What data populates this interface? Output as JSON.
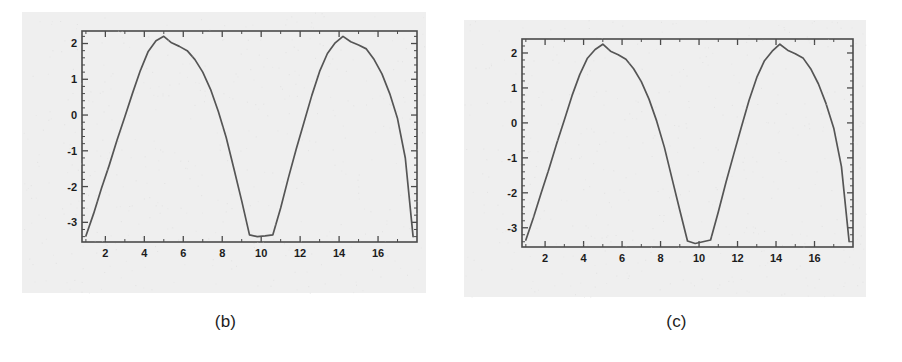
{
  "figure": {
    "background_color": "#ffffff",
    "plate_color": "#eeeeee",
    "line_color": "#555555",
    "axis_color": "#4a4a4a",
    "tick_label_color": "#1c1c1c"
  },
  "panels": [
    {
      "id": "b",
      "caption": "(b)"
    },
    {
      "id": "c",
      "caption": "(c)"
    }
  ],
  "chart_data": [
    {
      "type": "line",
      "panel": "b",
      "title": "",
      "subtitle": "",
      "caption": "(b)",
      "xlabel": "",
      "ylabel": "",
      "xlim": [
        0.8,
        18.0
      ],
      "ylim": [
        -3.55,
        2.35
      ],
      "grid": false,
      "legend": null,
      "frame": "box-with-inward-ticks",
      "x_ticks_major": [
        2,
        4,
        6,
        8,
        10,
        12,
        14,
        16
      ],
      "x_tick_labels": [
        "2",
        "4",
        "6",
        "8",
        "10",
        "12",
        "14",
        "16"
      ],
      "x_ticks_minor": [
        1,
        3,
        5,
        7,
        9,
        11,
        13,
        15,
        17
      ],
      "y_ticks_major": [
        2,
        1,
        0,
        -1,
        -2,
        -3
      ],
      "y_tick_labels": [
        "2",
        "1",
        "0",
        "-1",
        "-2",
        "-3"
      ],
      "y_ticks_minor": [
        2.2,
        1.8,
        1.6,
        1.4,
        1.2,
        0.8,
        0.6,
        0.4,
        0.2,
        -0.2,
        -0.4,
        -0.6,
        -0.8,
        -1.2,
        -1.4,
        -1.6,
        -1.8,
        -2.2,
        -2.4,
        -2.6,
        -2.8,
        -3.2,
        -3.4
      ],
      "x": [
        1.0,
        1.4,
        1.8,
        2.2,
        2.6,
        3.0,
        3.4,
        3.8,
        4.2,
        4.6,
        5.0,
        5.4,
        5.8,
        6.2,
        6.6,
        7.0,
        7.4,
        7.8,
        8.2,
        8.6,
        9.0,
        9.4,
        9.8,
        10.2,
        10.6,
        11.0,
        11.4,
        11.8,
        12.2,
        12.6,
        13.0,
        13.4,
        13.8,
        14.2,
        14.6,
        15.0,
        15.4,
        15.8,
        16.2,
        16.6,
        17.0,
        17.4,
        17.8
      ],
      "y": [
        -3.38,
        -2.75,
        -2.05,
        -1.4,
        -0.7,
        -0.05,
        0.62,
        1.25,
        1.78,
        2.08,
        2.2,
        2.02,
        1.92,
        1.8,
        1.55,
        1.2,
        0.72,
        0.1,
        -0.62,
        -1.5,
        -2.4,
        -3.35,
        -3.4,
        -3.38,
        -3.35,
        -2.6,
        -1.75,
        -0.95,
        -0.2,
        0.55,
        1.22,
        1.72,
        2.02,
        2.2,
        2.05,
        1.96,
        1.85,
        1.55,
        1.15,
        0.6,
        -0.1,
        -1.2,
        -3.4
      ],
      "series": [
        {
          "name": "signal-b",
          "values": [
            -3.38,
            -2.75,
            -2.05,
            -1.4,
            -0.7,
            -0.05,
            0.62,
            1.25,
            1.78,
            2.08,
            2.2,
            2.02,
            1.92,
            1.8,
            1.55,
            1.2,
            0.72,
            0.1,
            -0.62,
            -1.5,
            -2.4,
            -3.35,
            -3.4,
            -3.38,
            -3.35,
            -2.6,
            -1.75,
            -0.95,
            -0.2,
            0.55,
            1.22,
            1.72,
            2.02,
            2.2,
            2.05,
            1.96,
            1.85,
            1.55,
            1.15,
            0.6,
            -0.1,
            -1.2,
            -3.4
          ]
        }
      ],
      "peak_values": [
        2.2,
        2.2
      ],
      "peak_positions": [
        5.0,
        14.2
      ],
      "trough_value": -3.4,
      "trough_positions": [
        9.4,
        10.6
      ],
      "period": 9.2
    },
    {
      "type": "line",
      "panel": "c",
      "title": "",
      "subtitle": "",
      "caption": "(c)",
      "xlabel": "",
      "ylabel": "",
      "xlim": [
        0.8,
        18.0
      ],
      "ylim": [
        -3.55,
        2.4
      ],
      "grid": false,
      "legend": null,
      "frame": "box-with-inward-ticks",
      "x_ticks_major": [
        2,
        4,
        6,
        8,
        10,
        12,
        14,
        16
      ],
      "x_tick_labels": [
        "2",
        "4",
        "6",
        "8",
        "10",
        "12",
        "14",
        "16"
      ],
      "x_ticks_minor": [
        1,
        3,
        5,
        7,
        9,
        11,
        13,
        15,
        17
      ],
      "y_ticks_major": [
        2,
        1,
        0,
        -1,
        -2,
        -3
      ],
      "y_tick_labels": [
        "2",
        "1",
        "0",
        "-1",
        "-2",
        "-3"
      ],
      "y_ticks_minor": [
        2.2,
        1.8,
        1.6,
        1.4,
        1.2,
        0.8,
        0.6,
        0.4,
        0.2,
        -0.2,
        -0.4,
        -0.6,
        -0.8,
        -1.2,
        -1.4,
        -1.6,
        -1.8,
        -2.2,
        -2.4,
        -2.6,
        -2.8,
        -3.2,
        -3.4
      ],
      "x": [
        1.0,
        1.4,
        1.8,
        2.2,
        2.6,
        3.0,
        3.4,
        3.8,
        4.2,
        4.6,
        5.0,
        5.4,
        5.8,
        6.2,
        6.6,
        7.0,
        7.4,
        7.8,
        8.2,
        8.6,
        9.0,
        9.4,
        9.8,
        10.2,
        10.6,
        11.0,
        11.4,
        11.8,
        12.2,
        12.6,
        13.0,
        13.4,
        13.8,
        14.2,
        14.6,
        15.0,
        15.4,
        15.8,
        16.2,
        16.6,
        17.0,
        17.4,
        17.8
      ],
      "y": [
        -3.35,
        -2.7,
        -2.0,
        -1.32,
        -0.6,
        0.08,
        0.78,
        1.38,
        1.85,
        2.1,
        2.25,
        2.05,
        1.95,
        1.82,
        1.55,
        1.18,
        0.68,
        0.05,
        -0.7,
        -1.6,
        -2.5,
        -3.38,
        -3.45,
        -3.4,
        -3.35,
        -2.55,
        -1.7,
        -0.9,
        -0.12,
        0.65,
        1.3,
        1.78,
        2.05,
        2.25,
        2.08,
        1.98,
        1.86,
        1.55,
        1.12,
        0.55,
        -0.15,
        -1.25,
        -3.4
      ],
      "series": [
        {
          "name": "signal-c",
          "values": [
            -3.35,
            -2.7,
            -2.0,
            -1.32,
            -0.6,
            0.08,
            0.78,
            1.38,
            1.85,
            2.1,
            2.25,
            2.05,
            1.95,
            1.82,
            1.55,
            1.18,
            0.68,
            0.05,
            -0.7,
            -1.6,
            -2.5,
            -3.38,
            -3.45,
            -3.4,
            -3.35,
            -2.55,
            -1.7,
            -0.9,
            -0.12,
            0.65,
            1.3,
            1.78,
            2.05,
            2.25,
            2.08,
            1.98,
            1.86,
            1.55,
            1.12,
            0.55,
            -0.15,
            -1.25,
            -3.4
          ]
        }
      ],
      "peak_values": [
        2.25,
        2.25
      ],
      "peak_positions": [
        5.0,
        14.2
      ],
      "trough_value": -3.45,
      "trough_positions": [
        9.8,
        10.6
      ],
      "period": 9.2
    }
  ]
}
